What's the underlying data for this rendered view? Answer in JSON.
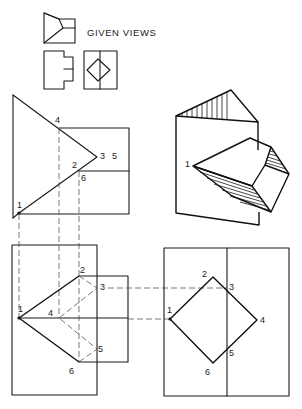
{
  "header": {
    "title": "GIVEN VIEWS"
  },
  "views": {
    "given_views": {
      "label": "GIVEN VIEWS",
      "icons": [
        "front-view-thumbnail",
        "side-view-thumbnail",
        "end-view-thumbnail"
      ]
    },
    "top_view": {
      "labels": {
        "p4": "4",
        "p3": "3",
        "p5": "5",
        "p2": "2",
        "p6": "6",
        "p1": "1"
      }
    },
    "front_view": {
      "labels": {
        "p1": "1",
        "p2": "2",
        "p3": "3",
        "p4": "4",
        "p5": "5",
        "p6": "6"
      }
    },
    "side_view": {
      "labels": {
        "p1": "1",
        "p2": "2",
        "p3": "3",
        "p4": "4",
        "p5": "5",
        "p6": "6"
      }
    },
    "isometric_view": {
      "labels": {
        "p1": "1"
      }
    }
  },
  "colors": {
    "line": "#1a1a1a",
    "dashed": "#555555",
    "background": "#ffffff"
  }
}
